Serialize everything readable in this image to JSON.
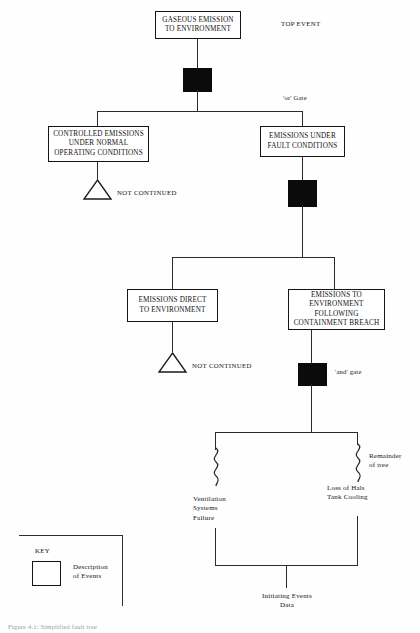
{
  "diagram": {
    "title_caption": "Figure 4.1: Simplified fault tree",
    "annotations": {
      "top_event": "TOP EVENT",
      "or_gate": "'or' Gate",
      "and_gate": "'and' gate",
      "remainder_of_tree": "Remainder\nof tree",
      "not_continued_upper": "NOT CONTINUED",
      "not_continued_lower": "NOT CONTINUED",
      "initiating_events_data": "Initiating Events\nData"
    },
    "events": [
      {
        "id": "top",
        "label": "GASEOUS EMISSION\nTO ENVIRONMENT"
      },
      {
        "id": "controlled",
        "label": "CONTROLLED EMISSIONS\nUNDER NORMAL\nOPERATING CONDITIONS"
      },
      {
        "id": "fault",
        "label": "EMISSIONS UNDER\nFAULT CONDITIONS"
      },
      {
        "id": "direct",
        "label": "EMISSIONS DIRECT\nTO ENVIRONMENT"
      },
      {
        "id": "breach",
        "label": "EMISSIONS TO\nENVIRONMENT FOLLOWING\nCONTAINMENT BREACH"
      }
    ],
    "basic_events": [
      {
        "id": "ventilation",
        "label": "Ventilation\nSystems\nFailure"
      },
      {
        "id": "hals",
        "label": "Loss of Hals\nTank Cooling"
      }
    ],
    "gates": [
      {
        "id": "gate-1",
        "type": "or"
      },
      {
        "id": "gate-2",
        "type": "or"
      },
      {
        "id": "gate-3",
        "type": "and"
      }
    ],
    "key": {
      "title": "KEY",
      "description": "Description\nof Events"
    },
    "colors": {
      "line": "#2b2b2b",
      "gate_fill": "#0b0b0b",
      "box_border": "#151515",
      "text": "#111111",
      "background": "#fefefe"
    }
  }
}
